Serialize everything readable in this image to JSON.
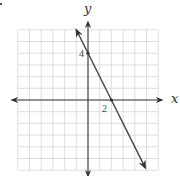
{
  "chart_data": {
    "type": "line",
    "title": "",
    "xlabel": "x",
    "ylabel": "y",
    "xlim": [
      -6,
      6
    ],
    "ylim": [
      -6,
      6
    ],
    "grid": true,
    "grid_step": 1,
    "tick_labels": [
      {
        "axis": "x",
        "value": 2,
        "label": "2"
      },
      {
        "axis": "y",
        "value": 4,
        "label": "4"
      }
    ],
    "series": [
      {
        "name": "line",
        "equation": "y = -2x + 4",
        "slope": -2,
        "intercept": 4,
        "x": [
          -1,
          0,
          2,
          4.9
        ],
        "y": [
          6,
          4,
          0,
          -5.8
        ],
        "arrows": "both"
      }
    ],
    "marked_points": [
      {
        "x": 0,
        "y": 4
      },
      {
        "x": 2,
        "y": 0
      }
    ],
    "legend": null
  },
  "labels": {
    "x_axis": "x",
    "y_axis": "y",
    "x_tick": "2",
    "y_tick": "4"
  },
  "colors": {
    "grid": "#d6d6d6",
    "axis": "#3a3a3a",
    "line": "#3a3a3a"
  }
}
